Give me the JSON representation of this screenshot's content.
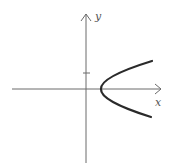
{
  "diagram": {
    "type": "coordinate-plot",
    "axes": {
      "x_label": "x",
      "y_label": "y"
    },
    "tick": {
      "axis": "y",
      "position": "positive",
      "label": ""
    },
    "curve": {
      "shape": "parabola",
      "opens": "right",
      "vertex_side": "positive-x"
    },
    "colors": {
      "axis": "#6a6a6a",
      "curve": "#2a2a2a",
      "background": "#ffffff"
    }
  }
}
